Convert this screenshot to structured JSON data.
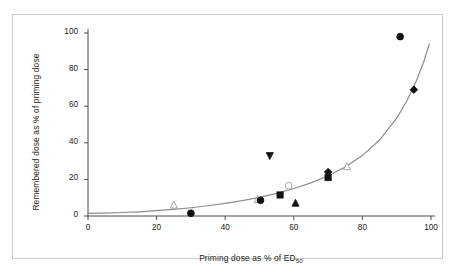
{
  "figure": {
    "background_color": "#ffffff",
    "frame_color": "#c9c9c9",
    "axis_color": "#4d4d4d",
    "marker_color": "#111111",
    "curve_color": "#8c8c8c"
  },
  "chart_data": {
    "type": "scatter",
    "title": "",
    "xlabel": "Priming dose as % of ED",
    "xlabel_sub": "50",
    "ylabel": "Remembered dose as % of priming dose",
    "xlim": [
      0,
      100
    ],
    "ylim": [
      0,
      100
    ],
    "xticks": [
      0,
      20,
      40,
      60,
      80,
      100
    ],
    "yticks": [
      0,
      20,
      40,
      60,
      80,
      100
    ],
    "xtick_labels": [
      "0",
      "20",
      "40",
      "60",
      "80",
      "100"
    ],
    "ytick_labels": [
      "0",
      "20",
      "40",
      "60",
      "80",
      "100"
    ],
    "grid": false,
    "legend": false,
    "legend_position": "none",
    "points": [
      {
        "x": 25.0,
        "y": 6.0,
        "marker": "triangle-up",
        "filled": false
      },
      {
        "x": 30.0,
        "y": 1.5,
        "marker": "circle",
        "filled": true
      },
      {
        "x": 49.5,
        "y": 9.0,
        "marker": "triangle-up",
        "filled": false
      },
      {
        "x": 50.3,
        "y": 8.6,
        "marker": "circle",
        "filled": true
      },
      {
        "x": 53.0,
        "y": 33.0,
        "marker": "triangle-down",
        "filled": true
      },
      {
        "x": 56.0,
        "y": 11.5,
        "marker": "square",
        "filled": true
      },
      {
        "x": 58.5,
        "y": 16.5,
        "marker": "circle",
        "filled": false
      },
      {
        "x": 60.5,
        "y": 7.0,
        "marker": "triangle-up",
        "filled": true
      },
      {
        "x": 70.0,
        "y": 24.0,
        "marker": "diamond",
        "filled": true
      },
      {
        "x": 70.0,
        "y": 21.0,
        "marker": "square",
        "filled": true
      },
      {
        "x": 75.5,
        "y": 27.0,
        "marker": "triangle-up",
        "filled": false
      },
      {
        "x": 91.0,
        "y": 98.0,
        "marker": "circle",
        "filled": true
      },
      {
        "x": 95.0,
        "y": 69.0,
        "marker": "diamond",
        "filled": true
      }
    ],
    "fit_curve": {
      "description": "exponential fit line",
      "points": [
        {
          "x": 0,
          "y": 1.4
        },
        {
          "x": 5,
          "y": 1.6
        },
        {
          "x": 10,
          "y": 1.9
        },
        {
          "x": 15,
          "y": 2.3
        },
        {
          "x": 20,
          "y": 2.9
        },
        {
          "x": 25,
          "y": 3.6
        },
        {
          "x": 30,
          "y": 4.5
        },
        {
          "x": 35,
          "y": 5.6
        },
        {
          "x": 40,
          "y": 6.9
        },
        {
          "x": 45,
          "y": 8.4
        },
        {
          "x": 50,
          "y": 10.2
        },
        {
          "x": 55,
          "y": 12.4
        },
        {
          "x": 60,
          "y": 15.0
        },
        {
          "x": 65,
          "y": 18.1
        },
        {
          "x": 70,
          "y": 22.0
        },
        {
          "x": 75,
          "y": 26.8
        },
        {
          "x": 80,
          "y": 33.0
        },
        {
          "x": 85,
          "y": 41.5
        },
        {
          "x": 90,
          "y": 53.5
        },
        {
          "x": 93,
          "y": 63.0
        },
        {
          "x": 96,
          "y": 75.0
        },
        {
          "x": 98,
          "y": 85.0
        },
        {
          "x": 99.5,
          "y": 94.0
        }
      ]
    }
  }
}
